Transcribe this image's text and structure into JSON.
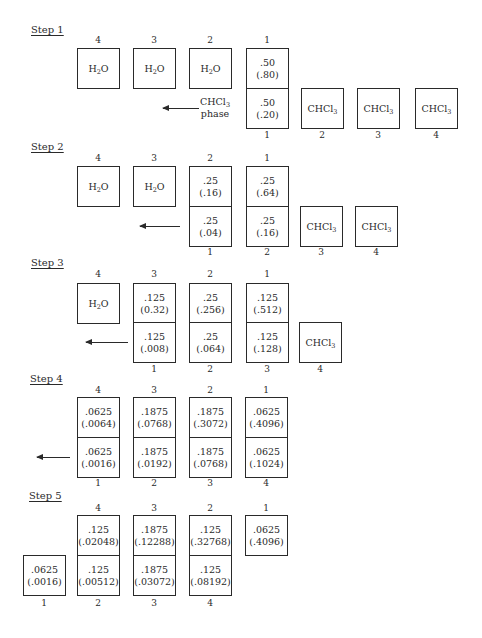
{
  "figure": {
    "solvents": {
      "upper": "H2O",
      "lower": "CHCl3"
    },
    "phase_label": [
      "CHCl3",
      "phase"
    ],
    "steps": [
      {
        "label": "Step 1",
        "top_numbers": [
          "4",
          "3",
          "2",
          "1"
        ],
        "bottom_numbers": [
          "1",
          "2",
          "3",
          "4"
        ],
        "top_cells": [
          {
            "type": "solvent",
            "text": "H2O"
          },
          {
            "type": "solvent",
            "text": "H2O"
          },
          {
            "type": "solvent",
            "text": "H2O"
          },
          {
            "type": "value",
            "a": ".50",
            "b": "(.80)"
          }
        ],
        "bottom_cells": [
          {
            "type": "value",
            "a": ".50",
            "b": "(.20)"
          },
          {
            "type": "solvent",
            "text": "CHCl3"
          },
          {
            "type": "solvent",
            "text": "CHCl3"
          },
          {
            "type": "solvent",
            "text": "CHCl3"
          }
        ]
      },
      {
        "label": "Step 2",
        "top_numbers": [
          "4",
          "3",
          "2",
          "1"
        ],
        "bottom_numbers": [
          "1",
          "2",
          "3",
          "4"
        ],
        "top_cells": [
          {
            "type": "solvent",
            "text": "H2O"
          },
          {
            "type": "solvent",
            "text": "H2O"
          },
          {
            "type": "value",
            "a": ".25",
            "b": "(.16)"
          },
          {
            "type": "value",
            "a": ".25",
            "b": "(.64)"
          }
        ],
        "bottom_cells": [
          {
            "type": "value",
            "a": ".25",
            "b": "(.04)"
          },
          {
            "type": "value",
            "a": ".25",
            "b": "(.16)"
          },
          {
            "type": "solvent",
            "text": "CHCl3"
          },
          {
            "type": "solvent",
            "text": "CHCl3"
          }
        ]
      },
      {
        "label": "Step 3",
        "top_numbers": [
          "4",
          "3",
          "2",
          "1"
        ],
        "bottom_numbers": [
          "1",
          "2",
          "3",
          "4"
        ],
        "top_cells": [
          {
            "type": "solvent",
            "text": "H2O"
          },
          {
            "type": "value",
            "a": ".125",
            "b": "(0.32)"
          },
          {
            "type": "value",
            "a": ".25",
            "b": "(.256)"
          },
          {
            "type": "value",
            "a": ".125",
            "b": "(.512)"
          }
        ],
        "bottom_cells": [
          {
            "type": "value",
            "a": ".125",
            "b": "(.008)"
          },
          {
            "type": "value",
            "a": ".25",
            "b": "(.064)"
          },
          {
            "type": "value",
            "a": ".125",
            "b": "(.128)"
          },
          {
            "type": "solvent",
            "text": "CHCl3"
          }
        ]
      },
      {
        "label": "Step 4",
        "top_numbers": [
          "4",
          "3",
          "2",
          "1"
        ],
        "bottom_numbers": [
          "1",
          "2",
          "3",
          "4"
        ],
        "top_cells": [
          {
            "type": "value",
            "a": ".0625",
            "b": "(.0064)"
          },
          {
            "type": "value",
            "a": ".1875",
            "b": "(.0768)"
          },
          {
            "type": "value",
            "a": ".1875",
            "b": "(.3072)"
          },
          {
            "type": "value",
            "a": ".0625",
            "b": "(.4096)"
          }
        ],
        "bottom_cells": [
          {
            "type": "value",
            "a": ".0625",
            "b": "(.0016)"
          },
          {
            "type": "value",
            "a": ".1875",
            "b": "(.0192)"
          },
          {
            "type": "value",
            "a": ".1875",
            "b": "(.0768)"
          },
          {
            "type": "value",
            "a": ".0625",
            "b": "(.1024)"
          }
        ]
      },
      {
        "label": "Step 5",
        "top_numbers": [
          "4",
          "3",
          "2",
          "1"
        ],
        "bottom_numbers": [
          "1",
          "2",
          "3",
          "4"
        ],
        "top_cells": [
          {
            "type": "value",
            "a": ".125",
            "b": "(.02048)"
          },
          {
            "type": "value",
            "a": ".1875",
            "b": "(.12288)"
          },
          {
            "type": "value",
            "a": ".125",
            "b": "(.32768)"
          },
          {
            "type": "value",
            "a": ".0625",
            "b": "(.4096)"
          }
        ],
        "bottom_cells": [
          {
            "type": "value",
            "a": ".0625",
            "b": "(.0016)"
          },
          {
            "type": "value",
            "a": ".125",
            "b": "(.00512)"
          },
          {
            "type": "value",
            "a": ".1875",
            "b": "(.03072)"
          },
          {
            "type": "value",
            "a": ".125",
            "b": "(.08192)"
          }
        ]
      }
    ]
  }
}
